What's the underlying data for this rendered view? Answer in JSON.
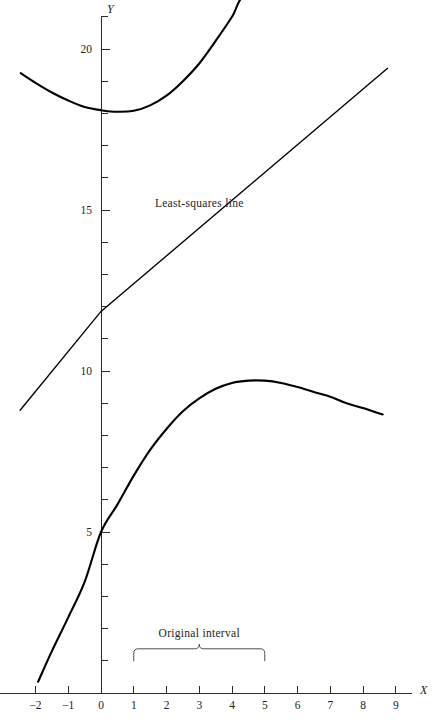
{
  "chart_data": {
    "type": "line",
    "title": "",
    "xlabel": "X",
    "ylabel": "Y",
    "xlim": [
      -2.5,
      9.6
    ],
    "ylim": [
      0,
      21.7
    ],
    "grid": false,
    "legend_position": "inline-annotation",
    "x_ticks": [
      -2,
      -1,
      0,
      1,
      2,
      3,
      4,
      5,
      6,
      7,
      8,
      9
    ],
    "x_tick_labels": [
      "−2",
      "−1",
      "0",
      "1",
      "2",
      "3",
      "4",
      "5",
      "6",
      "7",
      "8",
      "9"
    ],
    "y_ticks": [
      1,
      2,
      3,
      4,
      5,
      6,
      7,
      8,
      9,
      10,
      11,
      12,
      13,
      14,
      15,
      16,
      17,
      18,
      19,
      20,
      21
    ],
    "y_tick_labels_shown": [
      "5",
      "10",
      "15",
      "20"
    ],
    "y_labeled_ticks": [
      5,
      10,
      15,
      20
    ],
    "annotations": [
      {
        "name": "least-squares-line-label",
        "text": "Least-squares line",
        "x": 3.0,
        "y": 15.1
      },
      {
        "name": "original-interval-label",
        "text": "Original interval",
        "x": 3.0,
        "y": 1.75
      }
    ],
    "interval_marker": {
      "label": "Original interval",
      "x_start": 1,
      "x_end": 5,
      "y": 1.0
    },
    "series": [
      {
        "name": "upper-curve",
        "type": "curve",
        "style": "solid-thick",
        "points": [
          {
            "x": -2.45,
            "y": 19.25
          },
          {
            "x": -2.0,
            "y": 18.95
          },
          {
            "x": -1.5,
            "y": 18.65
          },
          {
            "x": -1.0,
            "y": 18.4
          },
          {
            "x": -0.5,
            "y": 18.2
          },
          {
            "x": 0.0,
            "y": 18.1
          },
          {
            "x": 0.5,
            "y": 18.05
          },
          {
            "x": 1.0,
            "y": 18.08
          },
          {
            "x": 1.5,
            "y": 18.25
          },
          {
            "x": 2.0,
            "y": 18.55
          },
          {
            "x": 2.5,
            "y": 19.0
          },
          {
            "x": 3.0,
            "y": 19.55
          },
          {
            "x": 3.5,
            "y": 20.25
          },
          {
            "x": 4.0,
            "y": 21.0
          },
          {
            "x": 4.4,
            "y": 21.7
          },
          {
            "x": 5.3,
            "y": 21.75
          }
        ]
      },
      {
        "name": "least-squares-line",
        "type": "line",
        "style": "solid-thin",
        "points": [
          {
            "x": -2.47,
            "y": 8.78
          },
          {
            "x": 0.0,
            "y": 11.85
          },
          {
            "x": 8.75,
            "y": 19.4
          }
        ]
      },
      {
        "name": "lower-curve",
        "type": "curve",
        "style": "solid-thick",
        "points": [
          {
            "x": -1.92,
            "y": 0.35
          },
          {
            "x": -1.5,
            "y": 1.3
          },
          {
            "x": -1.0,
            "y": 2.35
          },
          {
            "x": -0.5,
            "y": 3.45
          },
          {
            "x": 0.0,
            "y": 5.0
          },
          {
            "x": 0.5,
            "y": 5.85
          },
          {
            "x": 1.0,
            "y": 6.75
          },
          {
            "x": 1.5,
            "y": 7.55
          },
          {
            "x": 2.0,
            "y": 8.2
          },
          {
            "x": 2.5,
            "y": 8.75
          },
          {
            "x": 3.0,
            "y": 9.15
          },
          {
            "x": 3.5,
            "y": 9.45
          },
          {
            "x": 4.0,
            "y": 9.63
          },
          {
            "x": 4.5,
            "y": 9.7
          },
          {
            "x": 5.0,
            "y": 9.7
          },
          {
            "x": 5.5,
            "y": 9.63
          },
          {
            "x": 6.0,
            "y": 9.5
          },
          {
            "x": 6.5,
            "y": 9.35
          },
          {
            "x": 7.0,
            "y": 9.2
          },
          {
            "x": 7.5,
            "y": 9.0
          },
          {
            "x": 8.0,
            "y": 8.85
          },
          {
            "x": 8.6,
            "y": 8.65
          }
        ]
      }
    ]
  },
  "axes": {
    "x_axis_name": "X",
    "y_axis_name": "Y"
  }
}
